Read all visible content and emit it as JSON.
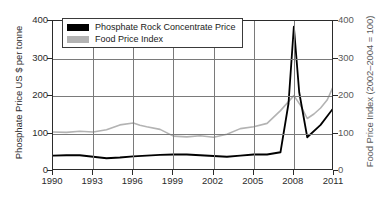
{
  "chart_data": {
    "type": "line",
    "title": "",
    "xlabel": "",
    "ylabel": "Phosphate Price US $ per tonne",
    "ylabel_right": "Food Price Index (2002–2004 = 100)",
    "xlim": [
      1990,
      2011
    ],
    "ylim": [
      0,
      400
    ],
    "ylim_right": [
      0,
      400
    ],
    "grid": true,
    "legend_position": "top-left-inside",
    "xticks": [
      "1990",
      "1993",
      "1996",
      "1999",
      "2002",
      "2005",
      "2008",
      "2011"
    ],
    "xtick_values": [
      1990,
      1993,
      1996,
      1999,
      2002,
      2005,
      2008,
      2011
    ],
    "yticks": [
      "0",
      "100",
      "200",
      "300",
      "400"
    ],
    "ytick_values": [
      0,
      100,
      200,
      300,
      400
    ],
    "yticks_right": [
      "0",
      "100",
      "200",
      "300",
      "400"
    ],
    "ytick_values_right": [
      0,
      100,
      200,
      300,
      400
    ],
    "series": [
      {
        "name": "Phosphate Rock Concentrate Price",
        "color": "#000000",
        "axis": "left",
        "x": [
          1990,
          1991,
          1992,
          1993,
          1994,
          1995,
          1996,
          1997,
          1998,
          1999,
          2000,
          2001,
          2002,
          2003,
          2004,
          2005,
          2006,
          2007,
          2007.6,
          2008,
          2008.4,
          2009,
          2010,
          2011
        ],
        "values": [
          41,
          42,
          42,
          38,
          34,
          36,
          39,
          41,
          43,
          44,
          44,
          42,
          40,
          38,
          41,
          44,
          44,
          50,
          180,
          385,
          210,
          90,
          123,
          170
        ]
      },
      {
        "name": "Food Price Index",
        "color": "#b3b3b3",
        "axis": "right",
        "x": [
          1990,
          1991,
          1992,
          1993,
          1994,
          1995,
          1996,
          1996.5,
          1997,
          1998,
          1999,
          2000,
          2001,
          2002,
          2003,
          2004,
          2005,
          2006,
          2007,
          2008,
          2008.5,
          2009,
          2009.5,
          2010,
          2010.5,
          2011
        ],
        "values": [
          104,
          103,
          106,
          104,
          110,
          123,
          128,
          122,
          118,
          111,
          93,
          91,
          94,
          90,
          98,
          113,
          118,
          127,
          161,
          201,
          175,
          140,
          152,
          168,
          190,
          230
        ]
      }
    ],
    "legend": [
      {
        "label": "Phosphate Rock Concentrate Price",
        "color": "#000000"
      },
      {
        "label": "Food Price Index",
        "color": "#b3b3b3"
      }
    ]
  },
  "axes": {
    "left_title": "Phosphate Price US $ per tonne",
    "right_title": "Food Price Index (2002–2004 = 100)"
  }
}
